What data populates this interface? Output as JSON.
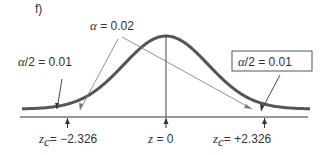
{
  "figure": {
    "panel_label": "f)",
    "alpha_label": {
      "symbol": "α",
      "eq": " = ",
      "value": "0.02"
    },
    "left_tail_label": {
      "symbol": "α",
      "rest": "/2",
      "eq": " = ",
      "value": "0.01"
    },
    "right_tail_label": {
      "symbol": "α",
      "rest": "/2",
      "eq": " = ",
      "value": "0.01"
    },
    "axis_labels": [
      {
        "var": "z",
        "sub": "c",
        "eq": "= ",
        "value": "−2.326"
      },
      {
        "var": "z",
        "sub": "",
        "eq": " = ",
        "value": "0"
      },
      {
        "var": "z",
        "sub": "c",
        "eq": "= ",
        "value": "+2.326"
      }
    ]
  },
  "chart_data": {
    "type": "line",
    "title": "",
    "distribution": "standard normal",
    "alpha": 0.02,
    "tail_area": 0.01,
    "critical_values": [
      -2.326,
      2.326
    ],
    "center": 0,
    "xlim": [
      -3.4,
      3.4
    ]
  }
}
